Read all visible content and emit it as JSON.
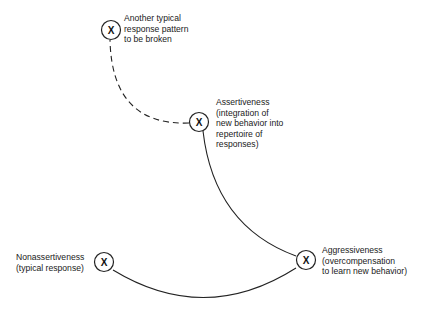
{
  "diagram": {
    "type": "behavior-change-cycle",
    "node_marker": "X",
    "nodes": [
      {
        "id": "another",
        "marker": "X",
        "lines": [
          "Another typical",
          "response pattern",
          "to be broken"
        ]
      },
      {
        "id": "assertiveness",
        "marker": "X",
        "lines": [
          "Assertiveness",
          "(integration of",
          "new behavior into",
          "repertoire of",
          "responses)"
        ]
      },
      {
        "id": "aggressiveness",
        "marker": "X",
        "lines": [
          "Aggressiveness",
          "(overcompensation",
          "to learn new behavior)"
        ]
      },
      {
        "id": "nonassertiveness",
        "marker": "X",
        "lines": [
          "Nonassertiveness",
          "(typical response)"
        ]
      }
    ],
    "edges": [
      {
        "from": "nonassertiveness",
        "to": "aggressiveness",
        "style": "solid"
      },
      {
        "from": "aggressiveness",
        "to": "assertiveness",
        "style": "solid"
      },
      {
        "from": "assertiveness",
        "to": "another",
        "style": "dashed"
      }
    ],
    "colors": {
      "line": "#222222",
      "text": "#1a1a1a",
      "background": "#ffffff"
    }
  }
}
